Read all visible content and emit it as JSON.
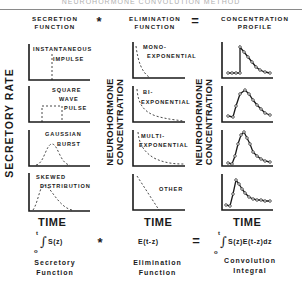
{
  "page_title_partial": "NEUROHORMONE CONVOLUTION METHOD",
  "headers": {
    "secretion": [
      "SECRETION",
      "FUNCTION"
    ],
    "operator_convolve": "*",
    "elimination": [
      "ELIMINATION",
      "FUNCTION"
    ],
    "operator_equals": "=",
    "concentration": [
      "CONCENTRATION",
      "PROFILE"
    ]
  },
  "axis_labels": {
    "secretory_rate": "SECRETORY RATE",
    "neurohormone_concentration": [
      "NEUROHORMONE",
      "CONCENTRATION"
    ],
    "time": "TIME"
  },
  "secretion_panels": [
    {
      "label": [
        "INSTANTANEOUS",
        "IMPULSE"
      ],
      "shape": "impulse"
    },
    {
      "label": [
        "SQUARE",
        "WAVE",
        "PULSE"
      ],
      "shape": "square"
    },
    {
      "label": [
        "GAUSSIAN",
        "BURST"
      ],
      "shape": "gaussian"
    },
    {
      "label": [
        "SKEWED",
        "DISTRIBUTION"
      ],
      "shape": "skewed"
    }
  ],
  "elimination_panels": [
    {
      "label": [
        "MONO-",
        "EXPONENTIAL"
      ],
      "shape": "mono-exponential"
    },
    {
      "label": [
        "BI-",
        "EXPONENTIAL"
      ],
      "shape": "bi-exponential"
    },
    {
      "label": [
        "MULTI-",
        "EXPONENTIAL"
      ],
      "shape": "multi-exponential"
    },
    {
      "label": [
        "OTHER"
      ],
      "shape": "linear"
    }
  ],
  "concentration_panels": [
    {
      "shape": "impulse-response"
    },
    {
      "shape": "square-response"
    },
    {
      "shape": "gaussian-response"
    },
    {
      "shape": "skewed-response"
    }
  ],
  "formulas": {
    "secretory": {
      "upper": "t",
      "lower": "o",
      "body": "S(z)"
    },
    "operator_convolve": "*",
    "elimination": "E(t-z)",
    "operator_equals": "=",
    "convolution": {
      "upper": "t",
      "lower": "o",
      "body": "S(z)E(t-z)dz"
    }
  },
  "captions": {
    "secretory": [
      "Secretory",
      "Function"
    ],
    "elimination": [
      "Elimination",
      "Function"
    ],
    "convolution": [
      "Convolution",
      "Integral"
    ]
  },
  "colors": {
    "ink": "#1a1a1a",
    "rule": "#8a8a8a",
    "faint": "#b0b0b0"
  }
}
